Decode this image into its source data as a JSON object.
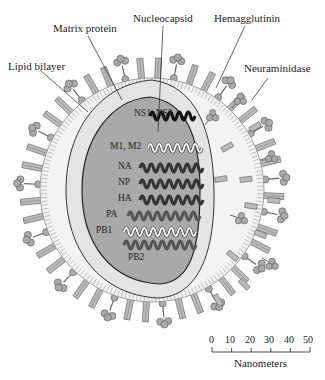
{
  "labels": {
    "lipid_bilayer": "Lipid bilayer",
    "matrix_protein": "Matrix protein",
    "nucleocapsid": "Nucleocapsid",
    "hemagglutinin": "Hemagglutinin",
    "neuraminidase": "Neuraminidase"
  },
  "segments": [
    {
      "label": "NS1, NS2",
      "style": "black"
    },
    {
      "label": "M1, M2",
      "style": "light"
    },
    {
      "label": "NA",
      "style": "dark"
    },
    {
      "label": "NP",
      "style": "dark"
    },
    {
      "label": "HA",
      "style": "dark"
    },
    {
      "label": "PA",
      "style": "medium"
    },
    {
      "label": "PB1",
      "style": "light"
    },
    {
      "label": "PB2",
      "style": "medium"
    }
  ],
  "scale": {
    "ticks": [
      "0",
      "10",
      "20",
      "30",
      "40",
      "50"
    ],
    "unit_label": "Nanometers"
  },
  "colors": {
    "core": "#a8a8a8",
    "matrix": "#e6e6e6",
    "envelope": "#f2f2f2",
    "spike": "#b5b5b5",
    "outline": "#333333"
  }
}
